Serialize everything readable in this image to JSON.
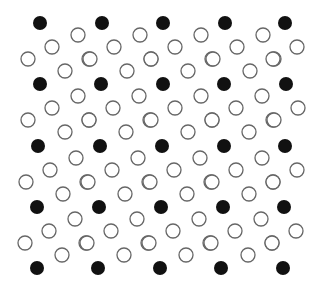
{
  "figure": {
    "width": 319,
    "height": 290,
    "background": "#ffffff",
    "dot_radius": 7,
    "open_radius": 7,
    "filled_color": "#111111",
    "open_stroke": "#666666",
    "open_fill": "#ffffff",
    "open_stroke_width": 1.3
  },
  "filled_rows": [
    {
      "y": 23,
      "x": [
        40,
        102,
        163,
        225,
        285
      ]
    },
    {
      "y": 84,
      "x": [
        40,
        101,
        163,
        224,
        286
      ]
    },
    {
      "y": 146,
      "x": [
        38,
        100,
        162,
        224,
        285
      ]
    },
    {
      "y": 207,
      "x": [
        37,
        99,
        161,
        223,
        284
      ]
    },
    {
      "y": 268,
      "x": [
        37,
        98,
        160,
        221,
        283
      ]
    }
  ],
  "open_offsets_cell": [
    [
      38,
      12
    ],
    [
      49,
      36
    ],
    [
      25,
      48
    ]
  ],
  "open_offsets_any": [
    [
      12,
      24
    ],
    [
      -12,
      36
    ]
  ]
}
